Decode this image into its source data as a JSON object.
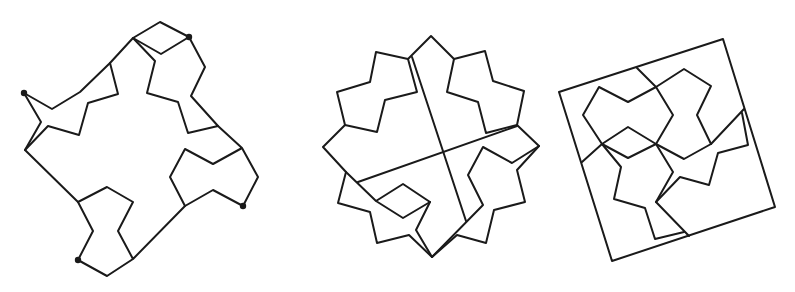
{
  "diagram": {
    "stroke_color": "#1a1a1a",
    "background": "#ffffff",
    "figures": [
      {
        "name": "irregular-polygon-dissection",
        "paths": [
          [
            [
              24,
              93
            ],
            [
              52,
              109
            ],
            [
              80,
              92
            ],
            [
              110,
              63
            ],
            [
              133,
              38
            ],
            [
              160,
              22
            ],
            [
              189,
              37
            ],
            [
              161,
              54
            ],
            [
              133,
              38
            ]
          ],
          [
            [
              133,
              38
            ],
            [
              155,
              61
            ],
            [
              147,
              93
            ],
            [
              178,
              102
            ],
            [
              188,
              133
            ],
            [
              218,
              126
            ],
            [
              191,
              96
            ],
            [
              205,
              67
            ],
            [
              189,
              37
            ]
          ],
          [
            [
              218,
              126
            ],
            [
              242,
              148
            ],
            [
              258,
              177
            ],
            [
              243,
              206
            ],
            [
              213,
              190
            ],
            [
              185,
              206
            ],
            [
              170,
              177
            ],
            [
              185,
              149
            ],
            [
              213,
              164
            ],
            [
              242,
              148
            ]
          ],
          [
            [
              185,
              206
            ],
            [
              133,
              259
            ],
            [
              107,
              276
            ],
            [
              78,
              260
            ],
            [
              93,
              231
            ],
            [
              78,
              202
            ],
            [
              107,
              187
            ],
            [
              133,
              202
            ],
            [
              118,
              231
            ],
            [
              133,
              259
            ]
          ],
          [
            [
              78,
              202
            ],
            [
              25,
              150
            ],
            [
              41,
              122
            ],
            [
              24,
              93
            ]
          ],
          [
            [
              25,
              150
            ],
            [
              48,
              126
            ],
            [
              79,
              135
            ],
            [
              88,
              103
            ],
            [
              118,
              94
            ],
            [
              110,
              63
            ]
          ]
        ],
        "dots": [
          [
            24,
            93
          ],
          [
            189,
            37
          ],
          [
            243,
            206
          ],
          [
            78,
            260
          ]
        ]
      },
      {
        "name": "star-polygon-dissection",
        "paths": [
          [
            [
              431,
              36
            ],
            [
              454,
              59
            ],
            [
              485,
              51
            ],
            [
              493,
              81
            ],
            [
              524,
              91
            ],
            [
              517,
              125
            ],
            [
              539,
              146
            ],
            [
              517,
              170
            ],
            [
              525,
              202
            ],
            [
              494,
              210
            ],
            [
              486,
              243
            ],
            [
              457,
              235
            ],
            [
              432,
              257
            ],
            [
              409,
              235
            ],
            [
              377,
              243
            ],
            [
              370,
              212
            ],
            [
              338,
              203
            ],
            [
              346,
              172
            ],
            [
              323,
              147
            ],
            [
              345,
              125
            ],
            [
              377,
              132
            ],
            [
              385,
              100
            ],
            [
              417,
              92
            ],
            [
              408,
              59
            ],
            [
              431,
              36
            ]
          ],
          [
            [
              408,
              59
            ],
            [
              376,
              52
            ],
            [
              370,
              82
            ],
            [
              337,
              92
            ],
            [
              345,
              125
            ]
          ],
          [
            [
              454,
              59
            ],
            [
              447,
              92
            ],
            [
              478,
              102
            ],
            [
              486,
              133
            ],
            [
              517,
              125
            ]
          ],
          [
            [
              412,
              57
            ],
            [
              466,
              221
            ]
          ],
          [
            [
              358,
              182
            ],
            [
              517,
              126
            ]
          ],
          [
            [
              539,
              146
            ],
            [
              512,
              163
            ],
            [
              483,
              147
            ],
            [
              468,
              175
            ],
            [
              483,
              205
            ],
            [
              432,
              257
            ]
          ],
          [
            [
              346,
              172
            ],
            [
              376,
              201
            ],
            [
              403,
              218
            ],
            [
              430,
              202
            ],
            [
              403,
              184
            ],
            [
              376,
              201
            ]
          ],
          [
            [
              430,
              202
            ],
            [
              416,
              230
            ],
            [
              432,
              257
            ]
          ]
        ],
        "dots": []
      },
      {
        "name": "square-dissection",
        "paths": [
          [
            [
              559,
              92
            ],
            [
              723,
              39
            ],
            [
              775,
              207
            ],
            [
              612,
              261
            ],
            [
              559,
              92
            ]
          ],
          [
            [
              637,
              68
            ],
            [
              656,
              87
            ],
            [
              673,
              115
            ],
            [
              656,
              144
            ],
            [
              628,
              158
            ],
            [
              602,
              144
            ],
            [
              582,
              162
            ]
          ],
          [
            [
              656,
              87
            ],
            [
              628,
              102
            ],
            [
              599,
              87
            ],
            [
              583,
              115
            ],
            [
              602,
              144
            ],
            [
              628,
              127
            ],
            [
              656,
              144
            ]
          ],
          [
            [
              656,
              87
            ],
            [
              684,
              69
            ],
            [
              711,
              86
            ],
            [
              697,
              115
            ],
            [
              711,
              144
            ],
            [
              684,
              159
            ],
            [
              656,
              144
            ]
          ],
          [
            [
              744,
              109
            ],
            [
              711,
              144
            ]
          ],
          [
            [
              742,
              113
            ],
            [
              748,
              145
            ],
            [
              718,
              153
            ],
            [
              709,
              185
            ],
            [
              680,
              177
            ],
            [
              656,
              202
            ]
          ],
          [
            [
              602,
              144
            ],
            [
              621,
              167
            ],
            [
              614,
              199
            ],
            [
              645,
              208
            ],
            [
              655,
              239
            ],
            [
              684,
              232
            ]
          ],
          [
            [
              656,
              144
            ],
            [
              673,
              172
            ],
            [
              656,
              202
            ],
            [
              689,
              236
            ]
          ]
        ],
        "dots": []
      }
    ]
  }
}
